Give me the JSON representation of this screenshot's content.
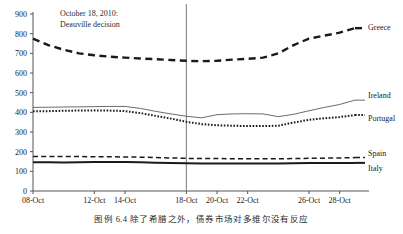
{
  "figure": {
    "caption": "图例 6.4  除了希腊之外，债券市场对多维尔没有反应",
    "annotation_line1": "October 18, 2010:",
    "annotation_line2": "Deauville decision"
  },
  "chart_data": {
    "type": "line",
    "title": "",
    "xlabel": "",
    "ylabel": "",
    "ylim": [
      0,
      900
    ],
    "ytick_values": [
      0,
      100,
      200,
      300,
      400,
      500,
      600,
      700,
      800,
      900
    ],
    "ytick_labels": [
      "0",
      "100",
      "200",
      "300",
      "400",
      "500",
      "600",
      "700",
      "800",
      "900"
    ],
    "x": [
      "08-Oct",
      "09-Oct",
      "10-Oct",
      "11-Oct",
      "12-Oct",
      "13-Oct",
      "14-Oct",
      "15-Oct",
      "16-Oct",
      "17-Oct",
      "18-Oct",
      "19-Oct",
      "20-Oct",
      "21-Oct",
      "22-Oct",
      "23-Oct",
      "24-Oct",
      "25-Oct",
      "26-Oct",
      "27-Oct",
      "28-Oct",
      "29-Oct"
    ],
    "xtick_labels": [
      "08-Oct",
      "12-Oct",
      "14-Oct",
      "18-Oct",
      "20-Oct",
      "22-Oct",
      "26-Oct",
      "28-Oct"
    ],
    "xtick_index": [
      0,
      4,
      6,
      10,
      12,
      14,
      18,
      20
    ],
    "grid": false,
    "legend_position": "right-inline",
    "annotation_x_index": 10,
    "series": [
      {
        "name": "Greece",
        "style": "thick-dashed",
        "color": "#1a1a1a",
        "values": [
          775,
          742,
          718,
          700,
          690,
          683,
          678,
          674,
          670,
          666,
          662,
          660,
          662,
          668,
          672,
          678,
          700,
          742,
          775,
          790,
          805,
          828
        ]
      },
      {
        "name": "Ireland",
        "style": "thin-solid",
        "color": "#5a5a5a",
        "values": [
          425,
          426,
          427,
          428,
          429,
          430,
          430,
          420,
          405,
          392,
          380,
          372,
          388,
          392,
          393,
          392,
          378,
          390,
          408,
          425,
          440,
          462
        ]
      },
      {
        "name": "Portugal",
        "style": "dotted",
        "color": "#1a1a1a",
        "values": [
          405,
          406,
          408,
          409,
          410,
          409,
          406,
          396,
          382,
          368,
          352,
          340,
          334,
          332,
          330,
          330,
          332,
          348,
          362,
          370,
          376,
          386
        ]
      },
      {
        "name": "Spain",
        "style": "dashed",
        "color": "#1a1a1a",
        "values": [
          176,
          176,
          175,
          175,
          174,
          174,
          173,
          172,
          170,
          168,
          166,
          165,
          165,
          164,
          164,
          164,
          164,
          165,
          166,
          167,
          168,
          170
        ]
      },
      {
        "name": "Italy",
        "style": "thick-solid",
        "color": "#1a1a1a",
        "values": [
          146,
          146,
          145,
          146,
          147,
          147,
          147,
          146,
          144,
          142,
          141,
          140,
          140,
          140,
          140,
          140,
          140,
          141,
          142,
          142,
          142,
          143
        ]
      }
    ]
  }
}
